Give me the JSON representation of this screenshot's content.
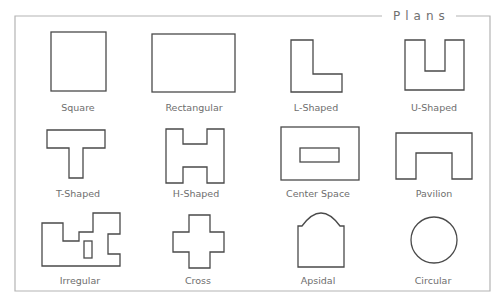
{
  "title": "Plans",
  "colors": {
    "frame": "#b4b4b4",
    "shape_stroke": "#4a4a4a",
    "label": "#6e6e6e",
    "background": "#ffffff"
  },
  "plans": [
    {
      "id": "square",
      "label": "Square",
      "row": 1,
      "col": 1
    },
    {
      "id": "rectangular",
      "label": "Rectangular",
      "row": 1,
      "col": 2
    },
    {
      "id": "l-shaped",
      "label": "L-Shaped",
      "row": 1,
      "col": 3
    },
    {
      "id": "u-shaped",
      "label": "U-Shaped",
      "row": 1,
      "col": 4
    },
    {
      "id": "t-shaped",
      "label": "T-Shaped",
      "row": 2,
      "col": 1
    },
    {
      "id": "h-shaped",
      "label": "H-Shaped",
      "row": 2,
      "col": 2
    },
    {
      "id": "center-space",
      "label": "Center Space",
      "row": 2,
      "col": 3
    },
    {
      "id": "pavilion",
      "label": "Pavilion",
      "row": 2,
      "col": 4
    },
    {
      "id": "irregular",
      "label": "Irregular",
      "row": 3,
      "col": 1
    },
    {
      "id": "cross",
      "label": "Cross",
      "row": 3,
      "col": 2
    },
    {
      "id": "apsidal",
      "label": "Apsidal",
      "row": 3,
      "col": 3
    },
    {
      "id": "circular",
      "label": "Circular",
      "row": 3,
      "col": 4
    }
  ]
}
